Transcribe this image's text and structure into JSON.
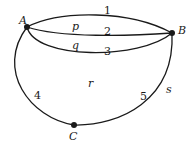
{
  "diagram": {
    "type": "planar-graph",
    "vertices": [
      {
        "id": "A",
        "label": "A"
      },
      {
        "id": "B",
        "label": "B"
      },
      {
        "id": "C",
        "label": "C"
      }
    ],
    "edges": [
      {
        "id": "1",
        "label": "1",
        "from": "A",
        "to": "B"
      },
      {
        "id": "2",
        "label": "2",
        "from": "A",
        "to": "B"
      },
      {
        "id": "3",
        "label": "3",
        "from": "A",
        "to": "B"
      },
      {
        "id": "4",
        "label": "4",
        "from": "A",
        "to": "C"
      },
      {
        "id": "5",
        "label": "5",
        "from": "C",
        "to": "B"
      }
    ],
    "faces": [
      {
        "id": "p",
        "label": "p"
      },
      {
        "id": "q",
        "label": "q"
      },
      {
        "id": "r",
        "label": "r"
      },
      {
        "id": "s",
        "label": "s"
      }
    ],
    "colors": {
      "stroke": "#1a1a1a",
      "background": "#ffffff"
    }
  }
}
